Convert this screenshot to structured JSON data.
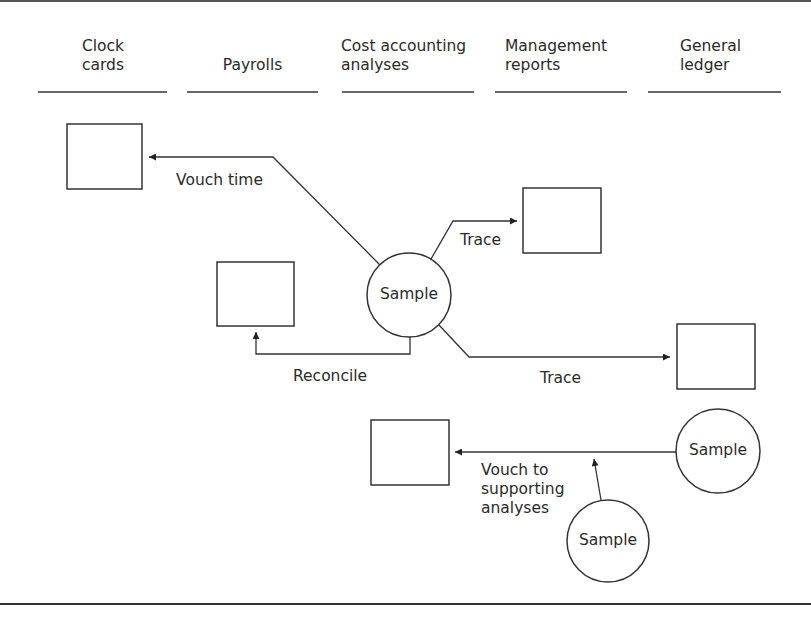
{
  "columns": [
    {
      "id": "clock-cards",
      "label": "Clock\ncards"
    },
    {
      "id": "payrolls",
      "label": "Payrolls"
    },
    {
      "id": "cost-accounting-analyses",
      "label": "Cost accounting\nanalyses"
    },
    {
      "id": "management-reports",
      "label": "Management\nreports"
    },
    {
      "id": "general-ledger",
      "label": "General\nledger"
    }
  ],
  "nodes": {
    "sample_main": {
      "label": "Sample"
    },
    "sample_ledger": {
      "label": "Sample"
    },
    "sample_lower": {
      "label": "Sample"
    }
  },
  "edges": [
    {
      "from": "sample_main",
      "to": "clock-cards",
      "label": "Vouch time"
    },
    {
      "from": "sample_main",
      "to": "payrolls",
      "label": "Reconcile"
    },
    {
      "from": "sample_main",
      "to": "management-reports",
      "label": "Trace"
    },
    {
      "from": "sample_main",
      "to": "general-ledger",
      "label": "Trace"
    },
    {
      "from": "sample_ledger",
      "to": "cost-accounting-analyses",
      "label": "Vouch to\nsupporting\nanalyses"
    },
    {
      "from": "sample_lower",
      "to": "cost-accounting-analyses",
      "label": ""
    }
  ],
  "colors": {
    "stroke": "#333333",
    "background": "#ffffff"
  }
}
